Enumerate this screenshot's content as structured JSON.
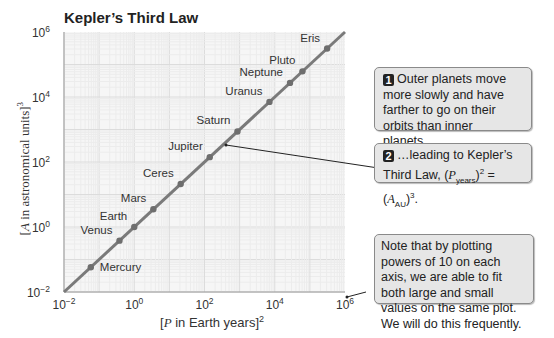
{
  "title": "Kepler’s Third Law",
  "axes": {
    "xlabel_var": "P",
    "xlabel_text": " in Earth years]",
    "xlabel_exp": "2",
    "ylabel_var": "A",
    "ylabel_text": " in astronomical units]",
    "ylabel_exp": "3"
  },
  "callouts": {
    "c1": {
      "num": "1",
      "text": "Outer planets move more slowly and have farther to go on their orbits than inner planets…"
    },
    "c2": {
      "num": "2",
      "text_pre": "…leading to Kepler’s Third Law, ",
      "p": "P",
      "p_sub": "years",
      "p_sup": "2",
      "eq": " = ",
      "a": "A",
      "a_sub": "AU",
      "a_sup": "3",
      "end": "."
    },
    "c3": {
      "text": "Note that by plotting powers of 10 on each axis, we are able to fit both large and small values on the same plot. We will do this frequently."
    }
  },
  "colors": {
    "line": "#7a7a7a",
    "point": "#6e6e6e",
    "grid": "#e4e4e4",
    "callout_bg": "#e6e6e6"
  },
  "chart_data": {
    "type": "line",
    "title": "Kepler’s Third Law",
    "xlabel": "[P in Earth years]^2",
    "ylabel": "[A in astronomical units]^3",
    "xscale": "log",
    "yscale": "log",
    "xlim": [
      0.01,
      1000000
    ],
    "ylim": [
      0.01,
      1000000
    ],
    "x_ticks": [
      "10^-2",
      "10^0",
      "10^2",
      "10^4",
      "10^6"
    ],
    "y_ticks": [
      "10^-2",
      "10^0",
      "10^2",
      "10^4",
      "10^6"
    ],
    "grid": true,
    "series": [
      {
        "name": "Planets / dwarf planets",
        "points": [
          {
            "label": "Mercury",
            "x": 0.058,
            "y": 0.058
          },
          {
            "label": "Venus",
            "x": 0.38,
            "y": 0.38
          },
          {
            "label": "Earth",
            "x": 1,
            "y": 1
          },
          {
            "label": "Mars",
            "x": 3.5,
            "y": 3.5
          },
          {
            "label": "Ceres",
            "x": 21,
            "y": 21
          },
          {
            "label": "Jupiter",
            "x": 141,
            "y": 141
          },
          {
            "label": "Saturn",
            "x": 868,
            "y": 868
          },
          {
            "label": "Uranus",
            "x": 7056,
            "y": 7056
          },
          {
            "label": "Neptune",
            "x": 27150,
            "y": 27150
          },
          {
            "label": "Pluto",
            "x": 61500,
            "y": 61500
          },
          {
            "label": "Eris",
            "x": 310000,
            "y": 310000
          }
        ]
      }
    ]
  }
}
